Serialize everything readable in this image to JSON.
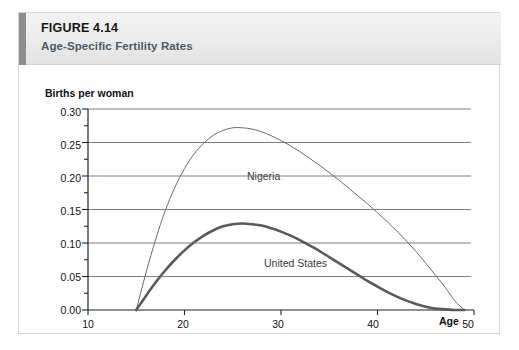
{
  "figure": {
    "number_prefix": "F",
    "number_rest": "IGURE",
    "number_full": "FIGURE 4.14",
    "number_value": "4.14",
    "subtitle": "Age-Specific Fertility Rates"
  },
  "axes": {
    "y_title": "Births per woman",
    "x_title": "Age",
    "y_ticks": [
      "0.30",
      "0.25",
      "0.20",
      "0.15",
      "0.10",
      "0.05",
      "0.00"
    ],
    "x_ticks": [
      "10",
      "20",
      "30",
      "40",
      "50"
    ]
  },
  "series_labels": {
    "nigeria": "Nigeria",
    "united_states": "United States"
  },
  "colors": {
    "accent_bar": "#8e8e8e",
    "header_bg": "#ebebeb",
    "subtitle_text": "#4a5a6a",
    "gridline": "#6f6f6f",
    "axis": "#222222",
    "nigeria_line": "#6b6b6b",
    "us_line": "#5a5a5a",
    "frame_border": "#d6d6d6"
  },
  "chart_data": {
    "type": "line",
    "title": "Age-Specific Fertility Rates",
    "xlabel": "Age",
    "ylabel": "Births per woman",
    "xlim": [
      10,
      50
    ],
    "ylim": [
      0.0,
      0.3
    ],
    "grid": true,
    "legend": "inline-labels",
    "x_ticks": [
      10,
      20,
      30,
      40,
      50
    ],
    "y_ticks": [
      0.0,
      0.05,
      0.1,
      0.15,
      0.2,
      0.25,
      0.3
    ],
    "y_minor_step": 0.025,
    "x": [
      15,
      16,
      17,
      18,
      19,
      20,
      21,
      22,
      23,
      24,
      25,
      26,
      27,
      28,
      29,
      30,
      31,
      32,
      33,
      34,
      35,
      36,
      37,
      38,
      39,
      40,
      41,
      42,
      43,
      44,
      45,
      46,
      47,
      48,
      49
    ],
    "series": [
      {
        "name": "Nigeria",
        "line_width": 1,
        "color": "#6b6b6b",
        "label_x": 27,
        "label_y": 0.285,
        "values": [
          0.0,
          0.055,
          0.105,
          0.148,
          0.183,
          0.211,
          0.233,
          0.249,
          0.261,
          0.268,
          0.272,
          0.272,
          0.27,
          0.266,
          0.26,
          0.253,
          0.245,
          0.236,
          0.226,
          0.216,
          0.205,
          0.194,
          0.182,
          0.17,
          0.158,
          0.145,
          0.132,
          0.118,
          0.103,
          0.087,
          0.07,
          0.052,
          0.034,
          0.014,
          0.0
        ]
      },
      {
        "name": "United States",
        "line_width": 2.6,
        "color": "#5a5a5a",
        "label_x": 31,
        "label_y": 0.148,
        "values": [
          0.0,
          0.021,
          0.041,
          0.059,
          0.075,
          0.089,
          0.101,
          0.111,
          0.119,
          0.125,
          0.128,
          0.129,
          0.128,
          0.126,
          0.122,
          0.117,
          0.111,
          0.104,
          0.096,
          0.088,
          0.079,
          0.07,
          0.061,
          0.052,
          0.043,
          0.035,
          0.027,
          0.02,
          0.014,
          0.009,
          0.005,
          0.002,
          0.001,
          0.0,
          0.0
        ]
      }
    ]
  }
}
